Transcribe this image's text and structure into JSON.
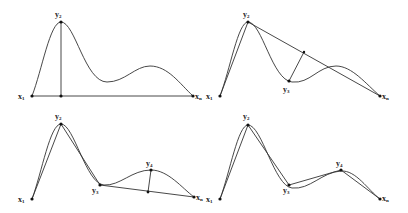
{
  "figure": {
    "panels": [
      {
        "id": "panel-1",
        "labels": [
          {
            "base": "x",
            "sub": "1",
            "x": 18,
            "y": 99
          },
          {
            "base": "y",
            "sub": "2",
            "x": 55,
            "y": 17
          },
          {
            "base": "x",
            "sub": "n",
            "x": 195,
            "y": 99
          }
        ]
      },
      {
        "id": "panel-2",
        "labels": [
          {
            "base": "x",
            "sub": "1",
            "x": 206,
            "y": 99
          },
          {
            "base": "y",
            "sub": "2",
            "x": 243,
            "y": 17
          },
          {
            "base": "y",
            "sub": "3",
            "x": 283,
            "y": 92
          },
          {
            "base": "x",
            "sub": "n",
            "x": 382,
            "y": 99
          }
        ]
      },
      {
        "id": "panel-3",
        "labels": [
          {
            "base": "x",
            "sub": "1",
            "x": 18,
            "y": 202
          },
          {
            "base": "y",
            "sub": "2",
            "x": 55,
            "y": 119
          },
          {
            "base": "y",
            "sub": "3",
            "x": 92,
            "y": 193
          },
          {
            "base": "y",
            "sub": "4",
            "x": 146,
            "y": 166
          },
          {
            "base": "x",
            "sub": "n",
            "x": 196,
            "y": 200
          }
        ]
      },
      {
        "id": "panel-4",
        "labels": [
          {
            "base": "x",
            "sub": "1",
            "x": 206,
            "y": 202
          },
          {
            "base": "y",
            "sub": "2",
            "x": 243,
            "y": 119
          },
          {
            "base": "y",
            "sub": "3",
            "x": 283,
            "y": 193
          },
          {
            "base": "y",
            "sub": "4",
            "x": 336,
            "y": 166
          },
          {
            "base": "x",
            "sub": "n",
            "x": 382,
            "y": 201
          }
        ]
      }
    ],
    "colors": {
      "stroke": "#333333",
      "point": "#111111",
      "text": "#222222",
      "background": "#ffffff"
    }
  }
}
